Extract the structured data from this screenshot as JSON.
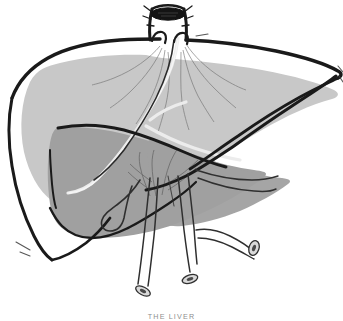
{
  "figure": {
    "caption": "THE LIVER",
    "subject": "liver",
    "style": "anatomical line drawing, grayscale"
  },
  "palette": {
    "background": "#ffffff",
    "outline": "#1a1a1a",
    "surface_light": "#c8c8c8",
    "surface_dark": "#a0a0a0",
    "surface_mid": "#b4b4b4",
    "vessel_line": "#3a3a3a",
    "vessel_hairline": "#6e6e6e",
    "vessel_pale": "#e8e8e8",
    "lumen_fill": "#141414",
    "caption_text": "#8e8e8e"
  },
  "parts": {
    "inferior_vena_cava": "inferior vena cava stump",
    "ivc_lumen": "vena cava lumen opening",
    "right_lobe": "right lobe of liver",
    "left_lobe": "left lobe of liver",
    "visceral_surface": "inferior visceral surface",
    "falciform_ligament": "falciform ligament",
    "hepatic_veins": "hepatic vein radiations",
    "bile_duct_branch": "intrahepatic bile duct branch",
    "porta_hepatis": "porta hepatis vessel bundle",
    "hepatic_artery": "hepatic artery with curl",
    "portal_vein": "portal vein",
    "common_bile_duct": "common bile duct",
    "cystic_duct": "cystic duct",
    "cut_end_1": "cut vessel cross-section",
    "cut_end_2": "cut vessel cross-section",
    "cut_end_3": "cut vessel cross-section"
  }
}
